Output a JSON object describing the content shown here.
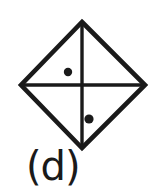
{
  "figure": {
    "label": "(d)",
    "shape_name": "diamond-with-cross-and-two-dots",
    "ink_color": "#1a1a1a",
    "background_color": "#ffffff",
    "canvas": {
      "width": 156,
      "height": 189
    },
    "diamond": {
      "top_vertex": {
        "x": 82,
        "y": 22
      },
      "right_vertex": {
        "x": 145,
        "y": 85
      },
      "bottom_vertex": {
        "x": 82,
        "y": 148
      },
      "left_vertex": {
        "x": 21,
        "y": 85
      },
      "stroke_width": 4.5
    },
    "cross": {
      "center": {
        "x": 82,
        "y": 85
      },
      "vertical": {
        "x": 82,
        "y1": 22,
        "y2": 148
      },
      "horizontal": {
        "y": 85,
        "x1": 21,
        "x2": 145
      },
      "stroke_width": 3.4
    },
    "dots": [
      {
        "name": "upper-left-dot",
        "cx": 68,
        "cy": 72,
        "r": 4.2,
        "quadrant": "upper-left"
      },
      {
        "name": "lower-right-dot",
        "cx": 89,
        "cy": 119,
        "r": 4.6,
        "quadrant": "lower-right"
      }
    ]
  }
}
